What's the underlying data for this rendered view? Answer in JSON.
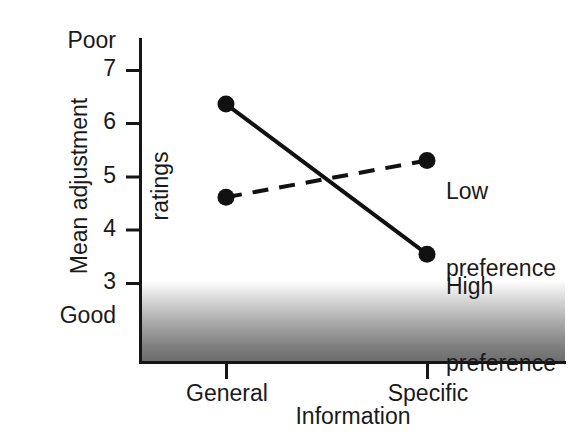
{
  "chart_data": {
    "type": "line",
    "title": "",
    "xlabel": "Information",
    "ylabel": "Mean adjustment ratings",
    "categories": [
      "General",
      "Specific"
    ],
    "ylim": [
      2.45,
      7.6
    ],
    "yticks": [
      3,
      4,
      5,
      6,
      7
    ],
    "ytick_labels": [
      "3",
      "4",
      "5",
      "6",
      "7"
    ],
    "y_axis_high_anchor": "Poor",
    "y_axis_low_anchor": "Good",
    "grid": false,
    "legend_position": "inline-right-of-endpoints",
    "series": [
      {
        "name": "High preference",
        "label_line1": "High",
        "label_line2": "preference",
        "style": "solid",
        "marker": "filled-circle",
        "color": "#111111",
        "values": [
          6.37,
          3.55
        ]
      },
      {
        "name": "Low preference",
        "label_line1": "Low",
        "label_line2": "preference",
        "style": "dashed",
        "marker": "filled-circle",
        "color": "#111111",
        "values": [
          4.62,
          5.31
        ]
      }
    ],
    "shaded_region": {
      "description": "gradient band from white to dark gray below rating 3",
      "from_value": 3.05,
      "to_value": 2.45,
      "color_top": "#ffffff",
      "color_bottom": "#6e6e6e"
    }
  },
  "axis": {
    "tick_7": "7",
    "tick_6": "6",
    "tick_5": "5",
    "tick_4": "4",
    "tick_3": "3",
    "poor": "Poor",
    "good": "Good",
    "x_general": "General",
    "x_specific": "Specific",
    "x_title": "Information",
    "y_title_line1": "Mean adjustment",
    "y_title_line2": "ratings"
  },
  "annotations": {
    "low_l1": "Low",
    "low_l2": "preference",
    "high_l1": "High",
    "high_l2": "preference"
  },
  "colors": {
    "ink": "#111111",
    "shade_bottom": "#6e6e6e",
    "background": "#ffffff"
  }
}
